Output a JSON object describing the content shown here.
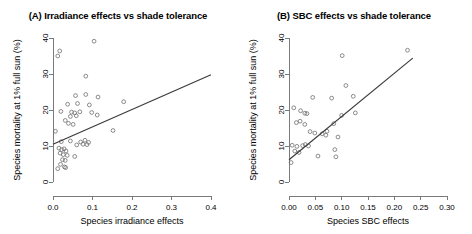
{
  "figure": {
    "background_color": "#ffffff",
    "point_color": "#6e6e6e",
    "line_color": "#3b3b3b",
    "axis_color": "#7a7a7a"
  },
  "chart_data": [
    {
      "type": "scatter",
      "panel": "A",
      "title": "(A) Irradiance effects vs shade tolerance",
      "xlabel": "Species irradiance effects",
      "ylabel": "Species mortality at 1% full sun (%)",
      "xlim": [
        0.0,
        0.4
      ],
      "ylim": [
        0,
        40
      ],
      "xticks": [
        0.0,
        0.1,
        0.2,
        0.3,
        0.4
      ],
      "xticklabels": [
        "0.0",
        "0.1",
        "0.2",
        "0.3",
        "0.4"
      ],
      "yticks": [
        0,
        10,
        20,
        30,
        40
      ],
      "yticklabels": [
        "0",
        "10",
        "20",
        "30",
        "40"
      ],
      "grid": false,
      "legend": "none",
      "marker": "open-circle",
      "fit_line": {
        "x": [
          0.0,
          0.4
        ],
        "y": [
          10.5,
          29.8
        ]
      },
      "points": [
        {
          "x": 0.012,
          "y": 35.0
        },
        {
          "x": 0.017,
          "y": 36.4
        },
        {
          "x": 0.104,
          "y": 39.1
        },
        {
          "x": 0.083,
          "y": 29.4
        },
        {
          "x": 0.057,
          "y": 24.0
        },
        {
          "x": 0.083,
          "y": 24.3
        },
        {
          "x": 0.114,
          "y": 23.6
        },
        {
          "x": 0.179,
          "y": 22.3
        },
        {
          "x": 0.037,
          "y": 21.6
        },
        {
          "x": 0.062,
          "y": 21.8
        },
        {
          "x": 0.092,
          "y": 21.4
        },
        {
          "x": 0.02,
          "y": 19.6
        },
        {
          "x": 0.047,
          "y": 19.4
        },
        {
          "x": 0.055,
          "y": 19.2
        },
        {
          "x": 0.068,
          "y": 19.5
        },
        {
          "x": 0.098,
          "y": 19.3
        },
        {
          "x": 0.044,
          "y": 18.2
        },
        {
          "x": 0.059,
          "y": 18.4
        },
        {
          "x": 0.112,
          "y": 18.6
        },
        {
          "x": 0.031,
          "y": 17.1
        },
        {
          "x": 0.039,
          "y": 16.3
        },
        {
          "x": 0.051,
          "y": 16.0
        },
        {
          "x": 0.006,
          "y": 14.1
        },
        {
          "x": 0.152,
          "y": 14.3
        },
        {
          "x": 0.021,
          "y": 11.2
        },
        {
          "x": 0.044,
          "y": 11.4
        },
        {
          "x": 0.07,
          "y": 11.1
        },
        {
          "x": 0.081,
          "y": 11.6
        },
        {
          "x": 0.09,
          "y": 11.0
        },
        {
          "x": 0.06,
          "y": 10.3
        },
        {
          "x": 0.076,
          "y": 10.5
        },
        {
          "x": 0.086,
          "y": 10.4
        },
        {
          "x": 0.015,
          "y": 9.4
        },
        {
          "x": 0.022,
          "y": 9.0
        },
        {
          "x": 0.028,
          "y": 9.2
        },
        {
          "x": 0.033,
          "y": 8.6
        },
        {
          "x": 0.018,
          "y": 8.0
        },
        {
          "x": 0.026,
          "y": 7.6
        },
        {
          "x": 0.036,
          "y": 7.4
        },
        {
          "x": 0.055,
          "y": 7.1
        },
        {
          "x": 0.024,
          "y": 6.2
        },
        {
          "x": 0.031,
          "y": 6.0
        },
        {
          "x": 0.019,
          "y": 4.9
        },
        {
          "x": 0.029,
          "y": 4.2
        },
        {
          "x": 0.032,
          "y": 4.0
        },
        {
          "x": 0.012,
          "y": 3.7
        }
      ]
    },
    {
      "type": "scatter",
      "panel": "B",
      "title": "(B) SBC effects vs shade tolerance",
      "xlabel": "Species SBC effects",
      "ylabel": "Species mortality at 1% full sun (%)",
      "xlim": [
        0.0,
        0.3
      ],
      "ylim": [
        0,
        40
      ],
      "xticks": [
        0.0,
        0.05,
        0.1,
        0.15,
        0.2,
        0.25,
        0.3
      ],
      "xticklabels": [
        "0.00",
        "0.05",
        "0.10",
        "0.15",
        "0.20",
        "0.25",
        "0.30"
      ],
      "yticks": [
        0,
        10,
        20,
        30,
        40
      ],
      "yticklabels": [
        "0",
        "10",
        "20",
        "30",
        "40"
      ],
      "grid": false,
      "legend": "none",
      "marker": "open-circle",
      "fit_line": {
        "x": [
          0.0,
          0.235
        ],
        "y": [
          6.2,
          34.4
        ]
      },
      "points": [
        {
          "x": 0.101,
          "y": 35.1
        },
        {
          "x": 0.225,
          "y": 36.6
        },
        {
          "x": 0.108,
          "y": 26.8
        },
        {
          "x": 0.122,
          "y": 23.8
        },
        {
          "x": 0.045,
          "y": 23.5
        },
        {
          "x": 0.081,
          "y": 23.3
        },
        {
          "x": 0.009,
          "y": 20.6
        },
        {
          "x": 0.022,
          "y": 19.8
        },
        {
          "x": 0.03,
          "y": 19.1
        },
        {
          "x": 0.034,
          "y": 19.0
        },
        {
          "x": 0.1,
          "y": 18.5
        },
        {
          "x": 0.126,
          "y": 19.2
        },
        {
          "x": 0.014,
          "y": 16.5
        },
        {
          "x": 0.021,
          "y": 16.9
        },
        {
          "x": 0.03,
          "y": 16.0
        },
        {
          "x": 0.085,
          "y": 16.2
        },
        {
          "x": 0.04,
          "y": 14.0
        },
        {
          "x": 0.049,
          "y": 13.6
        },
        {
          "x": 0.063,
          "y": 13.4
        },
        {
          "x": 0.072,
          "y": 14.1
        },
        {
          "x": 0.07,
          "y": 13.0
        },
        {
          "x": 0.093,
          "y": 12.5
        },
        {
          "x": 0.006,
          "y": 10.2
        },
        {
          "x": 0.015,
          "y": 9.9
        },
        {
          "x": 0.026,
          "y": 10.1
        },
        {
          "x": 0.031,
          "y": 10.4
        },
        {
          "x": 0.037,
          "y": 10.0
        },
        {
          "x": 0.011,
          "y": 8.6
        },
        {
          "x": 0.019,
          "y": 8.2
        },
        {
          "x": 0.087,
          "y": 9.0
        },
        {
          "x": 0.055,
          "y": 7.2
        },
        {
          "x": 0.089,
          "y": 7.0
        },
        {
          "x": 0.004,
          "y": 5.4
        }
      ]
    }
  ]
}
